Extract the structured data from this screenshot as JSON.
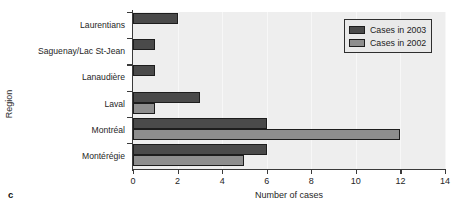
{
  "panel": {
    "letter": "c"
  },
  "axes": {
    "ylabel": "Region",
    "xlabel": "Number of cases"
  },
  "legend": {
    "items": [
      {
        "label": "Cases in 2003",
        "color": "#4a4a4a"
      },
      {
        "label": "Cases in 2002",
        "color": "#8e8e8e"
      }
    ]
  },
  "chart_data": {
    "type": "bar",
    "orientation": "horizontal",
    "title": "",
    "xlabel": "Number of cases",
    "ylabel": "Region",
    "xlim": [
      0,
      14
    ],
    "xticks": [
      0,
      2,
      4,
      6,
      8,
      10,
      12,
      14
    ],
    "grid": true,
    "legend_position": "top-right",
    "categories": [
      "Laurentians",
      "Saguenay/Lac St-Jean",
      "Lanaudière",
      "Laval",
      "Montréal",
      "Montérégie"
    ],
    "series": [
      {
        "name": "Cases in 2003",
        "color": "#4a4a4a",
        "values": [
          2,
          1,
          1,
          3,
          6,
          6
        ]
      },
      {
        "name": "Cases in 2002",
        "color": "#8e8e8e",
        "values": [
          0,
          0,
          0,
          1,
          12,
          5
        ]
      }
    ]
  }
}
